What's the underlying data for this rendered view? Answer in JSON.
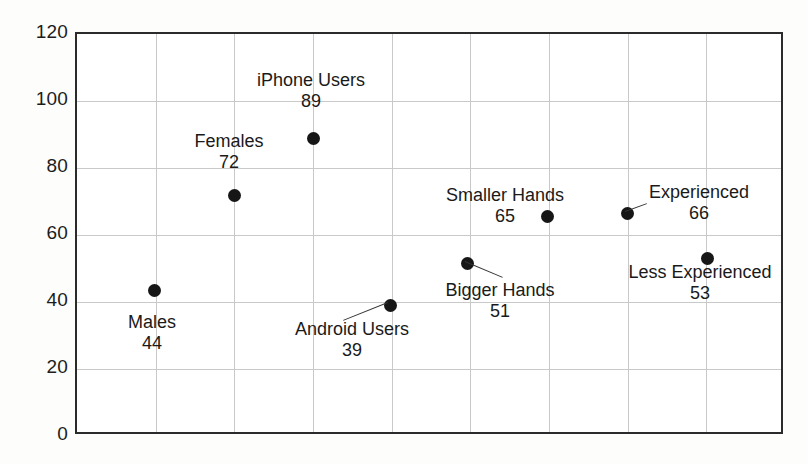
{
  "chart_data": {
    "type": "scatter",
    "title": "",
    "xlabel": "",
    "ylabel": "",
    "ylim": [
      0,
      120
    ],
    "ytick_step": 20,
    "ytick_labels": [
      "120",
      "100",
      "80",
      "60",
      "40",
      "20",
      "0"
    ],
    "grid": true,
    "legend": "none",
    "x_gridline_count": 8,
    "categories": [
      "Males",
      "Females",
      "iPhone Users",
      "Android Users",
      "Bigger Hands",
      "Smaller Hands",
      "Experienced",
      "Less Experienced"
    ],
    "values": [
      44,
      72,
      89,
      39,
      51,
      65,
      66,
      53
    ],
    "points": [
      {
        "label": "Males",
        "value_label": "44",
        "value": 44,
        "x_px": 152,
        "y_px": 288,
        "annot_left": 152,
        "annot_top": 312,
        "leader": false
      },
      {
        "label": "Females",
        "value_label": "72",
        "value": 72,
        "x_px": 232,
        "y_px": 193,
        "annot_left": 229,
        "annot_top": 131,
        "leader": false
      },
      {
        "label": "iPhone Users",
        "value_label": "89",
        "value": 89,
        "x_px": 311,
        "y_px": 136,
        "annot_left": 311,
        "annot_top": 70,
        "leader": false
      },
      {
        "label": "Android Users",
        "value_label": "39",
        "value": 39,
        "x_px": 388,
        "y_px": 303,
        "annot_left": 352,
        "annot_top": 319,
        "leader": true,
        "leader_dx": -45,
        "leader_dy": 18
      },
      {
        "label": "Bigger Hands",
        "value_label": "51",
        "value": 51,
        "x_px": 465,
        "y_px": 261,
        "annot_left": 500,
        "annot_top": 280,
        "leader": true,
        "leader_dx": 38,
        "leader_dy": 16
      },
      {
        "label": "Smaller Hands",
        "value_label": "65",
        "value": 65,
        "x_px": 545,
        "y_px": 214,
        "annot_left": 505,
        "annot_top": 185,
        "leader": false
      },
      {
        "label": "Experienced",
        "value_label": "66",
        "value": 66,
        "x_px": 625,
        "y_px": 211,
        "annot_left": 699,
        "annot_top": 182,
        "leader": true,
        "leader_dx": 22,
        "leader_dy": -8
      },
      {
        "label": "Less Experienced",
        "value_label": "53",
        "value": 53,
        "x_px": 705,
        "y_px": 256,
        "annot_left": 700,
        "annot_top": 262,
        "leader": false
      }
    ]
  }
}
